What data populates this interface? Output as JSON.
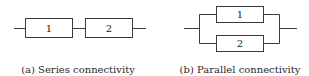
{
  "diagrams": [
    {
      "id": "series",
      "caption": "(a) Series connectivity",
      "blocks": [
        "1",
        "2"
      ]
    },
    {
      "id": "parallel",
      "caption": "(b) Parallel connectivity",
      "blocks": [
        "1",
        "2"
      ]
    }
  ],
  "colors": {
    "line": "#3a3a3a",
    "text": "#2a2a2a",
    "background": "#ffffff"
  }
}
